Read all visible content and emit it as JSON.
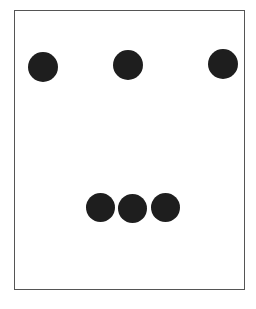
{
  "diagram": {
    "frame": {
      "border_color": "#555555",
      "background": "#ffffff"
    },
    "dot_color": "#1e1e1e",
    "top_row": [
      {
        "cx": 43,
        "cy": 67,
        "d": 30
      },
      {
        "cx": 128,
        "cy": 65,
        "d": 30
      },
      {
        "cx": 223,
        "cy": 64,
        "d": 30
      }
    ],
    "bottom_group": [
      {
        "cx": 100,
        "cy": 207,
        "d": 29
      },
      {
        "cx": 132,
        "cy": 208,
        "d": 29
      },
      {
        "cx": 165,
        "cy": 207,
        "d": 29
      }
    ]
  }
}
